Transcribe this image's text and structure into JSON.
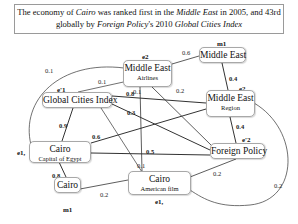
{
  "caption": {
    "p1": "The economy of ",
    "p2": "Cairo",
    "p3": " was ranked first in the ",
    "p4": "Middle East",
    "p5": " in 2005, and 43rd",
    "p6": "globally by ",
    "p7": "Foreign Policy",
    "p8": "'s 2010 ",
    "p9": "Global Cities Index"
  },
  "nodes": {
    "m1_top": {
      "main": "Middle East",
      "tag": "m1"
    },
    "e2_airlines": {
      "main": "Middle East",
      "sub": "Airlines",
      "tag": "e2"
    },
    "ep1_gci": {
      "main": "Global Cities Index",
      "tag": "e'1"
    },
    "ep2_region": {
      "main": "Middle East",
      "sub": "Region",
      "tag": "e2,"
    },
    "e1_capital": {
      "main": "Cairo",
      "sub": "Capital of Egypt",
      "tag": "e1,"
    },
    "ep3_fp": {
      "main": "Foreign Policy",
      "tag": "e'2"
    },
    "m1_cairo": {
      "main": "Cairo",
      "tag": "m1"
    },
    "e1_film": {
      "main": "Cairo",
      "sub": "American film",
      "tag": "e1,"
    }
  },
  "edges": [
    {
      "from": "m1_top",
      "to": "e2_airlines",
      "weight": "0.6"
    },
    {
      "from": "m1_top",
      "to": "ep2_region",
      "weight": "0.4"
    },
    {
      "from": "e2_airlines",
      "to": "e1_capital",
      "weight": "0.1",
      "curved": true
    },
    {
      "from": "e2_airlines",
      "to": "ep1_gci",
      "weight": "0.1"
    },
    {
      "from": "e2_airlines",
      "to": "e1_film",
      "weight": "0.1"
    },
    {
      "from": "e2_airlines",
      "to": "ep3_fp",
      "weight": "0.2"
    },
    {
      "from": "ep1_gci",
      "to": "ep2_region",
      "weight": "0.8"
    },
    {
      "from": "ep1_gci",
      "to": "ep3_fp",
      "weight": "0.3"
    },
    {
      "from": "ep1_gci",
      "to": "e1_capital",
      "weight": "0.9"
    },
    {
      "from": "ep1_gci",
      "to": "e1_film",
      "weight": "0.1"
    },
    {
      "from": "e1_capital",
      "to": "ep2_region",
      "weight": "0.6"
    },
    {
      "from": "e1_capital",
      "to": "ep3_fp",
      "weight": "0.5"
    },
    {
      "from": "e1_capital",
      "to": "m1_cairo",
      "weight": "0.8"
    },
    {
      "from": "ep2_region",
      "to": "ep3_fp",
      "weight": "0.4"
    },
    {
      "from": "ep2_region",
      "to": "e1_film",
      "weight": "0.2",
      "curved": true
    },
    {
      "from": "ep3_fp",
      "to": "e1_film",
      "weight": "0.2"
    },
    {
      "from": "m1_cairo",
      "to": "e1_film",
      "weight": "0.2"
    }
  ]
}
